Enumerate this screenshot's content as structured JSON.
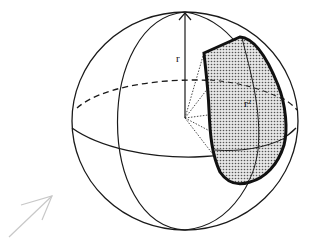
{
  "diagram": {
    "labels": {
      "radius": "r",
      "area": "r²"
    },
    "colors": {
      "stroke": "#1a1a1a",
      "patch_fill": "#d9d9d9",
      "patch_dots": "#555555",
      "arrow": "#c8c8c8",
      "background": "#ffffff"
    },
    "elements": [
      "sphere-outline",
      "equator-back-dashed",
      "equator-front",
      "meridian",
      "radius-axis-arrow",
      "shaded-patch",
      "cone-edges-dotted",
      "direction-arrow"
    ]
  }
}
